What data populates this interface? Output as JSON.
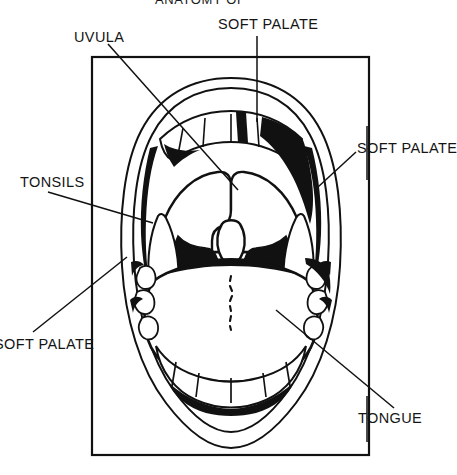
{
  "figure": {
    "kind": "anatomical-line-drawing",
    "title_partial": "ANATOMY OF",
    "frame": {
      "x": 92,
      "y": 57,
      "width": 277,
      "height": 398,
      "stroke": "#000000"
    },
    "background_color": "#ffffff",
    "ink_color": "#000000"
  },
  "labels": [
    {
      "id": "title-top",
      "text": "ANATOMY OF",
      "x": 155,
      "y": -7,
      "clipped": true,
      "clip_edge": "top"
    },
    {
      "id": "soft-palate-top",
      "text": "SOFT PALATE",
      "x": 218,
      "y": 17,
      "clipped": false
    },
    {
      "id": "uvula",
      "text": "UVULA",
      "x": 74,
      "y": 30,
      "clipped": false
    },
    {
      "id": "soft-palate-right",
      "text": "SOFT PALATE",
      "x": 357,
      "y": 141,
      "clipped": false
    },
    {
      "id": "tonsils",
      "text": "TONSILS",
      "x": 20,
      "y": 175,
      "clipped": false
    },
    {
      "id": "soft-palate-left",
      "text": "SOFT PALATE",
      "x": -6,
      "y": 337,
      "clipped": true,
      "clip_edge": "left"
    },
    {
      "id": "tongue",
      "text": "TONGUE",
      "x": 358,
      "y": 411,
      "clipped": false
    }
  ],
  "leader_lines": [
    {
      "id": "leader-soft-palate-top",
      "type": "vertical",
      "points": "257,36 257,122"
    },
    {
      "id": "leader-uvula",
      "type": "diagonal",
      "points": "108,44 238,190"
    },
    {
      "id": "leader-soft-palate-right",
      "type": "diagonal",
      "points": "354,152 320,186"
    },
    {
      "id": "leader-soft-palate-right-stem",
      "type": "vertical",
      "points": "367,128 367,178"
    },
    {
      "id": "leader-tonsils",
      "type": "diagonal",
      "points": "48,192 152,222"
    },
    {
      "id": "leader-tonsils-stem",
      "type": "vertical",
      "points": "92,178 92,345"
    },
    {
      "id": "leader-soft-palate-left",
      "type": "diagonal",
      "points": "33,332 126,258"
    },
    {
      "id": "leader-tongue",
      "type": "diagonal",
      "points": "276,310 394,408"
    },
    {
      "id": "leader-tongue-stem",
      "type": "vertical",
      "points": "367,396 367,440"
    }
  ],
  "anatomy_parts": [
    {
      "id": "lips-outer",
      "name": "lips outline",
      "fill": "none",
      "stroke": "#000000"
    },
    {
      "id": "upper-teeth",
      "name": "upper teeth row",
      "fill": "#ffffff",
      "stroke": "#000000"
    },
    {
      "id": "lower-teeth",
      "name": "lower teeth row",
      "fill": "#ffffff",
      "stroke": "#000000"
    },
    {
      "id": "soft-palate-arch",
      "name": "soft palate arch",
      "fill": "#ffffff",
      "stroke": "#000000"
    },
    {
      "id": "uvula",
      "name": "uvula",
      "fill": "#ffffff",
      "stroke": "#000000"
    },
    {
      "id": "oropharynx",
      "name": "throat cavity",
      "fill": "#000000",
      "stroke": "#000000"
    },
    {
      "id": "tonsil-left",
      "name": "left tonsil",
      "fill": "#ffffff",
      "stroke": "#000000"
    },
    {
      "id": "tonsil-right",
      "name": "right tonsil",
      "fill": "#ffffff",
      "stroke": "#000000"
    },
    {
      "id": "tongue",
      "name": "tongue",
      "fill": "#ffffff",
      "stroke": "#000000"
    },
    {
      "id": "tongue-midline",
      "name": "tongue median sulcus",
      "fill": "none",
      "stroke": "#000000"
    }
  ]
}
